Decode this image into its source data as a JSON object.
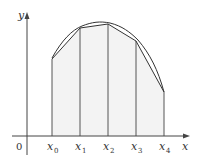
{
  "diagram": {
    "title": "",
    "axes": {
      "x_label": "x",
      "y_label": "y",
      "origin_label": "0"
    },
    "partition_labels": [
      {
        "base": "x",
        "sub": "0"
      },
      {
        "base": "x",
        "sub": "1"
      },
      {
        "base": "x",
        "sub": "2"
      },
      {
        "base": "x",
        "sub": "3"
      },
      {
        "base": "x",
        "sub": "4"
      }
    ],
    "colors": {
      "axis": "#444444",
      "curve": "#333333",
      "shading": "#f3f3f3",
      "text": "#333333"
    }
  }
}
